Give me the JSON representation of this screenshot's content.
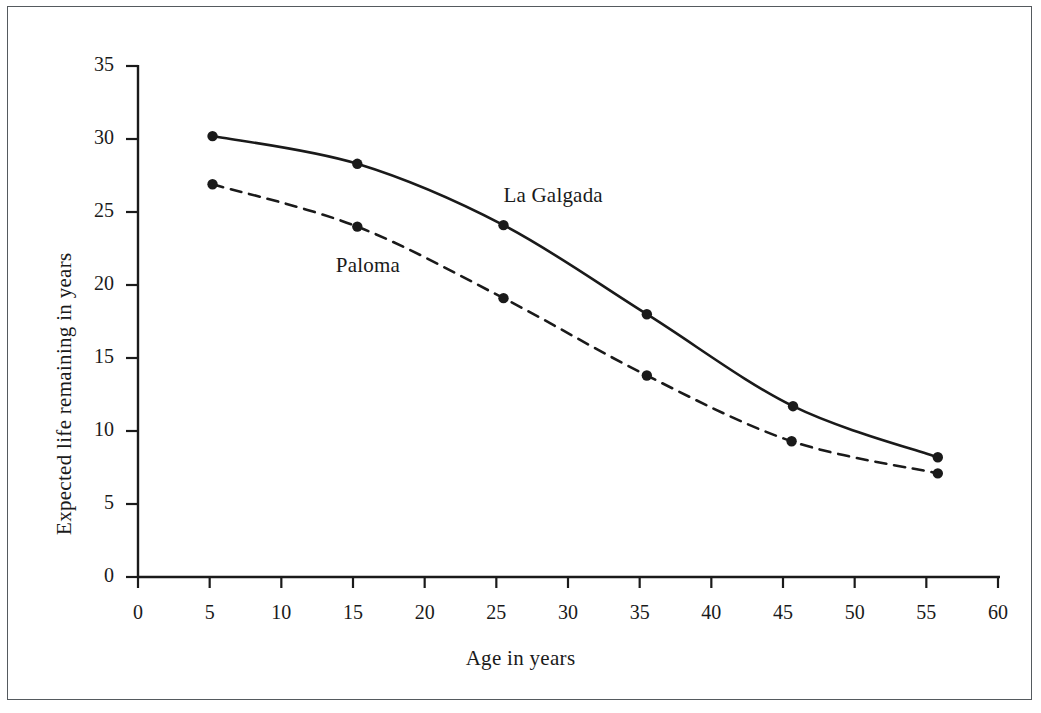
{
  "chart_data": {
    "type": "line",
    "title": "",
    "xlabel": "Age in years",
    "ylabel": "Expected life remaining in years",
    "xlim": [
      0,
      60
    ],
    "ylim": [
      0,
      35
    ],
    "xticks": [
      0,
      5,
      10,
      15,
      20,
      25,
      30,
      35,
      40,
      45,
      50,
      55,
      60
    ],
    "yticks": [
      0,
      5,
      10,
      15,
      20,
      25,
      30,
      35
    ],
    "xtick_labels": [
      "0",
      "5",
      "10",
      "15",
      "20",
      "25",
      "30",
      "35",
      "40",
      "45",
      "50",
      "55",
      "60"
    ],
    "ytick_labels": [
      "0",
      "5",
      "10",
      "15",
      "20",
      "25",
      "30",
      "35"
    ],
    "grid": false,
    "legend_position": "inline-annotation",
    "series": [
      {
        "name": "La Galgada",
        "style": "solid",
        "color": "#1a1a1a",
        "marker": "circle",
        "label_x": 25.5,
        "label_y": 26.1,
        "x": [
          5.2,
          15.3,
          25.5,
          35.5,
          45.7,
          55.8
        ],
        "values": [
          30.2,
          28.3,
          24.1,
          18.0,
          11.7,
          8.2
        ]
      },
      {
        "name": "Paloma",
        "style": "dashed",
        "color": "#1a1a1a",
        "marker": "circle",
        "label_x": 13.8,
        "label_y": 21.3,
        "x": [
          5.2,
          15.3,
          25.5,
          35.5,
          45.6,
          55.8
        ],
        "values": [
          26.9,
          24.0,
          19.1,
          13.8,
          9.3,
          7.1
        ]
      }
    ]
  },
  "figure": {
    "border_color": "#555a5e",
    "background": "#ffffff",
    "axis_color": "#1a1a1a"
  }
}
